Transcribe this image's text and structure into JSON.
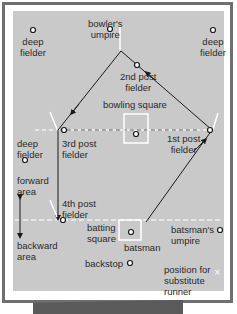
{
  "diagram": {
    "colors": {
      "field": "#c9c9c9",
      "frame": "#6f6f6f",
      "line": "#1a1a1a",
      "marking": "#ffffff",
      "bottom_bar": "#5a5a5a"
    },
    "labels": {
      "deep_fielder_tl": [
        "deep",
        "fielder"
      ],
      "bowlers_umpire": [
        "bowler's",
        "umpire"
      ],
      "deep_fielder_tr": [
        "deep",
        "fielder"
      ],
      "second_post": [
        "2nd post",
        "fielder"
      ],
      "bowling_square": "bowling square",
      "deep_fielder_l": [
        "deep",
        "fielder"
      ],
      "third_post": [
        "3rd post",
        "fielder"
      ],
      "first_post": [
        "1st post",
        "fielder"
      ],
      "forward_area": [
        "forward",
        "area"
      ],
      "fourth_post": [
        "4th post",
        "fielder"
      ],
      "backward_area": [
        "backward",
        "area"
      ],
      "batting_square": [
        "batting",
        "square"
      ],
      "batsman": "batsman",
      "batsmans_umpire": [
        "batsman's",
        "umpire"
      ],
      "backstop": "backstop",
      "substitute_runner": [
        "position for",
        "substitute",
        "runner"
      ]
    }
  }
}
